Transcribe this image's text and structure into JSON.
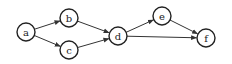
{
  "diagram": {
    "type": "directed-graph",
    "nodes": [
      {
        "id": "a",
        "label": "a",
        "x": 26,
        "y": 32
      },
      {
        "id": "b",
        "label": "b",
        "x": 69,
        "y": 18
      },
      {
        "id": "c",
        "label": "c",
        "x": 69,
        "y": 50
      },
      {
        "id": "d",
        "label": "d",
        "x": 118,
        "y": 36
      },
      {
        "id": "e",
        "label": "e",
        "x": 162,
        "y": 16
      },
      {
        "id": "f",
        "label": "f",
        "x": 206,
        "y": 38
      }
    ],
    "edges": [
      {
        "from": "a",
        "to": "b"
      },
      {
        "from": "a",
        "to": "c"
      },
      {
        "from": "b",
        "to": "d"
      },
      {
        "from": "c",
        "to": "d"
      },
      {
        "from": "d",
        "to": "e"
      },
      {
        "from": "d",
        "to": "f"
      },
      {
        "from": "e",
        "to": "f"
      }
    ],
    "node_radius": 9,
    "colors": {
      "stroke": "#222222",
      "fill": "#ffffff"
    }
  }
}
